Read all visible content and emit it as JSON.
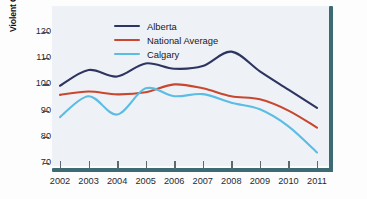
{
  "chart_data": {
    "type": "line",
    "title": "",
    "xlabel": "",
    "ylabel": "Violent Crime Severity Index",
    "x": [
      2002,
      2003,
      2004,
      2005,
      2006,
      2007,
      2008,
      2009,
      2010,
      2011
    ],
    "categories": [
      "2002",
      "2003",
      "2004",
      "2005",
      "2006",
      "2007",
      "2008",
      "2009",
      "2010",
      "2011"
    ],
    "xlim": [
      2002,
      2011
    ],
    "ylim": [
      70,
      120
    ],
    "yticks": [
      70,
      80,
      90,
      100,
      110,
      120
    ],
    "grid": false,
    "legend_position": "top-left",
    "smoothing": "spline",
    "series": [
      {
        "name": "Alberta",
        "color": "#2e3560",
        "values": [
          99.5,
          105.5,
          103.0,
          108.0,
          106.0,
          107.0,
          112.5,
          105.0,
          98.0,
          91.0
        ]
      },
      {
        "name": "National Average",
        "color": "#c8472e",
        "values": [
          96.0,
          97.3,
          96.2,
          97.0,
          100.0,
          98.5,
          95.5,
          94.3,
          90.0,
          83.5
        ]
      },
      {
        "name": "Calgary",
        "color": "#5bbce4",
        "values": [
          87.5,
          95.5,
          88.5,
          98.5,
          95.5,
          96.3,
          93.0,
          90.5,
          84.0,
          74.0
        ]
      }
    ]
  },
  "legend": {
    "items": [
      {
        "label": "Alberta",
        "color": "#2e3560"
      },
      {
        "label": "National Average",
        "color": "#c8472e"
      },
      {
        "label": "Calgary",
        "color": "#5bbce4"
      }
    ]
  },
  "axes": {
    "y_title": "Violent Crime Severity Index",
    "y_tick_labels": [
      "120",
      "110",
      "100",
      "90",
      "80",
      "70"
    ],
    "x_tick_labels": [
      "2002",
      "2003",
      "2004",
      "2005",
      "2006",
      "2007",
      "2008",
      "2009",
      "2010",
      "2011"
    ]
  },
  "colors": {
    "plot_background": "#eef2f7",
    "axis_rule": "#3d6b73",
    "alberta": "#2e3560",
    "national_average": "#c8472e",
    "calgary": "#5bbce4"
  }
}
